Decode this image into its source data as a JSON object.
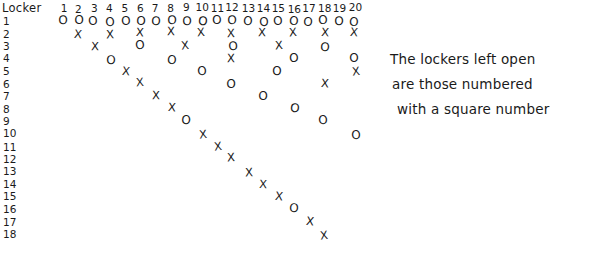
{
  "header": {
    "corner_label": "Locker",
    "columns": [
      1,
      2,
      3,
      4,
      5,
      6,
      7,
      8,
      9,
      10,
      11,
      12,
      13,
      14,
      15,
      16,
      17,
      18,
      19,
      20
    ]
  },
  "rows": [
    {
      "label": "1"
    },
    {
      "label": "2"
    },
    {
      "label": "3"
    },
    {
      "label": "4"
    },
    {
      "label": "5"
    },
    {
      "label": "6"
    },
    {
      "label": "7"
    },
    {
      "label": "8"
    },
    {
      "label": "9"
    },
    {
      "label": "10"
    },
    {
      "label": "11"
    },
    {
      "label": "12"
    },
    {
      "label": "13"
    },
    {
      "label": "14"
    },
    {
      "label": "15"
    },
    {
      "label": "16"
    },
    {
      "label": "17"
    },
    {
      "label": "18"
    }
  ],
  "marks": {
    "open_symbol": "O",
    "closed_symbol": "X",
    "grid": [
      {
        "row": 1,
        "cells": [
          [
            1,
            "O"
          ],
          [
            2,
            "O"
          ],
          [
            3,
            "O"
          ],
          [
            4,
            "O"
          ],
          [
            5,
            "O"
          ],
          [
            6,
            "O"
          ],
          [
            7,
            "O"
          ],
          [
            8,
            "O"
          ],
          [
            9,
            "O"
          ],
          [
            10,
            "O"
          ],
          [
            11,
            "O"
          ],
          [
            12,
            "O"
          ],
          [
            13,
            "O"
          ],
          [
            14,
            "O"
          ],
          [
            15,
            "O"
          ],
          [
            16,
            "O"
          ],
          [
            17,
            "O"
          ],
          [
            18,
            "O"
          ],
          [
            19,
            "O"
          ],
          [
            20,
            "O"
          ]
        ]
      },
      {
        "row": 2,
        "cells": [
          [
            2,
            "X"
          ],
          [
            4,
            "X"
          ],
          [
            6,
            "X"
          ],
          [
            8,
            "X"
          ],
          [
            10,
            "X"
          ],
          [
            12,
            "X"
          ],
          [
            14,
            "X"
          ],
          [
            16,
            "X"
          ],
          [
            18,
            "X"
          ],
          [
            20,
            "X"
          ]
        ]
      },
      {
        "row": 3,
        "cells": [
          [
            3,
            "X"
          ],
          [
            6,
            "O"
          ],
          [
            9,
            "X"
          ],
          [
            12,
            "O"
          ],
          [
            15,
            "X"
          ],
          [
            18,
            "O"
          ]
        ]
      },
      {
        "row": 4,
        "cells": [
          [
            4,
            "O"
          ],
          [
            8,
            "O"
          ],
          [
            12,
            "X"
          ],
          [
            16,
            "O"
          ],
          [
            20,
            "O"
          ]
        ]
      },
      {
        "row": 5,
        "cells": [
          [
            5,
            "X"
          ],
          [
            10,
            "O"
          ],
          [
            15,
            "O"
          ],
          [
            20,
            "X"
          ]
        ]
      },
      {
        "row": 6,
        "cells": [
          [
            6,
            "X"
          ],
          [
            12,
            "O"
          ],
          [
            18,
            "X"
          ]
        ]
      },
      {
        "row": 7,
        "cells": [
          [
            7,
            "X"
          ],
          [
            14,
            "O"
          ]
        ]
      },
      {
        "row": 8,
        "cells": [
          [
            8,
            "X"
          ],
          [
            16,
            "O"
          ]
        ]
      },
      {
        "row": 9,
        "cells": [
          [
            9,
            "O"
          ],
          [
            18,
            "O"
          ]
        ]
      },
      {
        "row": 10,
        "cells": [
          [
            10,
            "X"
          ],
          [
            20,
            "O"
          ]
        ]
      },
      {
        "row": 11,
        "cells": [
          [
            11,
            "X"
          ]
        ]
      },
      {
        "row": 12,
        "cells": [
          [
            12,
            "X"
          ]
        ]
      },
      {
        "row": 13,
        "cells": [
          [
            13,
            "X"
          ]
        ]
      },
      {
        "row": 14,
        "cells": [
          [
            14,
            "X"
          ]
        ]
      },
      {
        "row": 15,
        "cells": [
          [
            15,
            "X"
          ]
        ]
      },
      {
        "row": 16,
        "cells": [
          [
            16,
            "O"
          ]
        ]
      },
      {
        "row": 17,
        "cells": [
          [
            17,
            "X"
          ]
        ]
      },
      {
        "row": 18,
        "cells": [
          [
            18,
            "X"
          ]
        ]
      }
    ]
  },
  "annotation": {
    "lines": [
      "The lockers left open",
      "are those numbered",
      "with a square number"
    ]
  }
}
